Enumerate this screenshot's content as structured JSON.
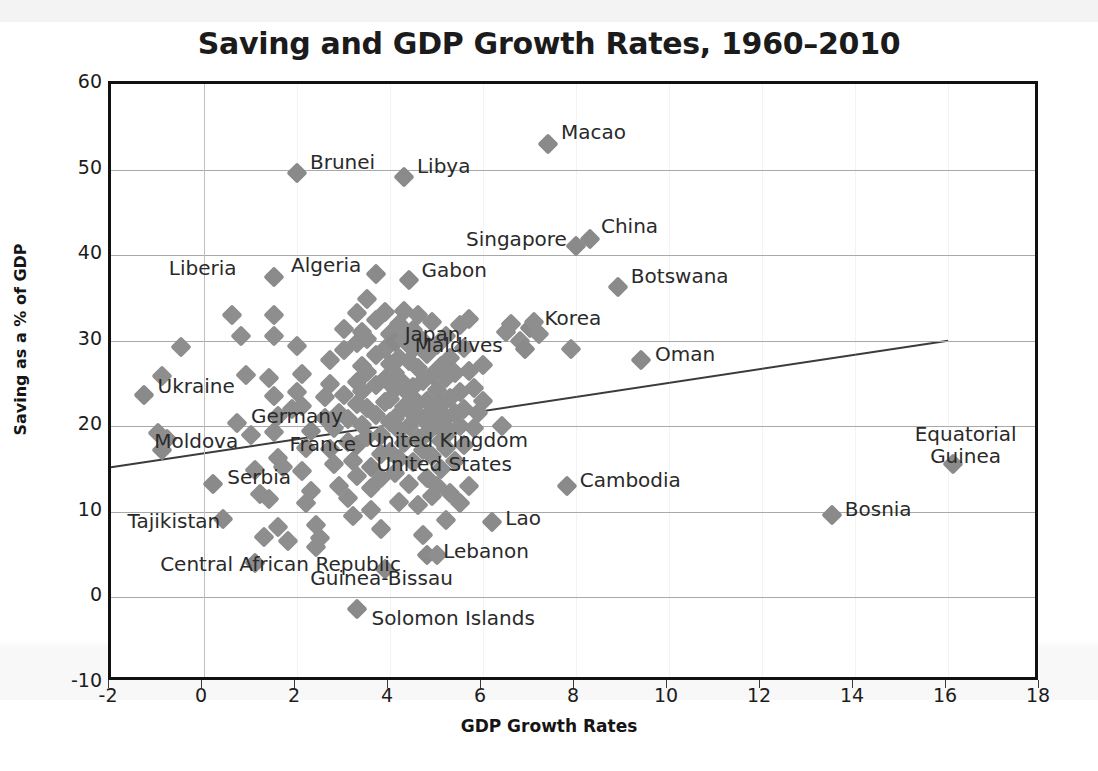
{
  "chart_data": {
    "type": "scatter",
    "title": "Saving and GDP Growth Rates, 1960–2010",
    "xlabel": "GDP Growth Rates",
    "ylabel": "Saving as a % of GDP",
    "xlim": [
      -2,
      18
    ],
    "ylim": [
      -10,
      60
    ],
    "xticks": [
      -2,
      0,
      2,
      4,
      6,
      8,
      10,
      12,
      14,
      16,
      18
    ],
    "yticks": [
      -10,
      0,
      10,
      20,
      30,
      40,
      50,
      60
    ],
    "xtick_labels": [
      "-2",
      "0",
      "2",
      "4",
      "6",
      "8",
      "10",
      "12",
      "14",
      "16",
      "18"
    ],
    "ytick_labels": [
      "-10",
      "0",
      "10",
      "20",
      "30",
      "40",
      "50",
      "60"
    ],
    "grid": "horizontal gridlines at every y tick plus vertical gridlines at every x tick (faint)",
    "legend": "none",
    "marker": {
      "shape": "diamond",
      "color": "#8e8e8e",
      "size": 15
    },
    "trendline": {
      "type": "linear",
      "color": "#3b3b3b",
      "x": [
        -2,
        16
      ],
      "y": [
        15.2,
        30.0
      ]
    },
    "labeled_points": [
      {
        "name": "Macao",
        "x": 7.4,
        "y": 53.0,
        "label_dx": 13,
        "label_dy": -11
      },
      {
        "name": "Brunei",
        "x": 2.0,
        "y": 49.6,
        "label_dx": 13,
        "label_dy": -10
      },
      {
        "name": "Libya",
        "x": 4.3,
        "y": 49.1,
        "label_dx": 13,
        "label_dy": -10
      },
      {
        "name": "China",
        "x": 8.3,
        "y": 41.9,
        "label_dx": 11,
        "label_dy": -12
      },
      {
        "name": "Singapore",
        "x": 8.0,
        "y": 41.1,
        "label_dx": -110,
        "label_dy": -6
      },
      {
        "name": "Botswana",
        "x": 8.9,
        "y": 36.3,
        "label_dx": 13,
        "label_dy": -10
      },
      {
        "name": "Liberia",
        "x": 1.5,
        "y": 37.5,
        "label_dx": -105,
        "label_dy": -8
      },
      {
        "name": "Algeria",
        "x": 3.7,
        "y": 37.8,
        "label_dx": -85,
        "label_dy": -8
      },
      {
        "name": "Gabon",
        "x": 4.4,
        "y": 37.1,
        "label_dx": 13,
        "label_dy": -9
      },
      {
        "name": "Korea",
        "x": 7.0,
        "y": 31.5,
        "label_dx": 15,
        "label_dy": -9
      },
      {
        "name": "Japan",
        "x": 4.1,
        "y": 29.9,
        "label_dx": 10,
        "label_dy": -7
      },
      {
        "name": "Maldives",
        "x": 6.9,
        "y": 29.0,
        "label_dx": -110,
        "label_dy": -3
      },
      {
        "name": "Oman",
        "x": 9.4,
        "y": 27.7,
        "label_dx": 14,
        "label_dy": -5
      },
      {
        "name": "Ukraine",
        "x": -1.3,
        "y": 23.6,
        "label_dx": 14,
        "label_dy": -8
      },
      {
        "name": "Germany",
        "x": 2.3,
        "y": 19.5,
        "label_dx": -60,
        "label_dy": -14
      },
      {
        "name": "France",
        "x": 2.7,
        "y": 17.3,
        "label_dx": -40,
        "label_dy": -4
      },
      {
        "name": "United Kingdom",
        "x": 3.3,
        "y": 17.8,
        "label_dx": 10,
        "label_dy": -4
      },
      {
        "name": "United States",
        "x": 3.6,
        "y": 15.3,
        "label_dx": 5,
        "label_dy": -2
      },
      {
        "name": "Moldova",
        "x": -0.9,
        "y": 17.2,
        "label_dx": -8,
        "label_dy": -8
      },
      {
        "name": "Serbia",
        "x": 0.2,
        "y": 13.3,
        "label_dx": 14,
        "label_dy": -6
      },
      {
        "name": "Equatorial Guinea",
        "x": 16.1,
        "y": 15.6,
        "label_dx": -38,
        "label_dy": -30
      },
      {
        "name": "Cambodia",
        "x": 7.8,
        "y": 13.0,
        "label_dx": 13,
        "label_dy": -5
      },
      {
        "name": "Bosnia",
        "x": 13.5,
        "y": 9.6,
        "label_dx": 13,
        "label_dy": -5
      },
      {
        "name": "Lao",
        "x": 6.2,
        "y": 8.8,
        "label_dx": 13,
        "label_dy": -3
      },
      {
        "name": "Tajikistan",
        "x": 0.4,
        "y": 9.2,
        "label_dx": -95,
        "label_dy": 3
      },
      {
        "name": "Lebanon",
        "x": 4.8,
        "y": 4.9,
        "label_dx": 16,
        "label_dy": -3
      },
      {
        "name": "Central African Republic",
        "x": 1.1,
        "y": 4.0,
        "label_dx": -95,
        "label_dy": 2
      },
      {
        "name": "Guinea-Bissau",
        "x": 3.9,
        "y": 3.3,
        "label_dx": -75,
        "label_dy": 10
      },
      {
        "name": "Solomon Islands",
        "x": 3.3,
        "y": -1.3,
        "label_dx": 14,
        "label_dy": 10
      }
    ],
    "points": [
      [
        -1.3,
        23.6
      ],
      [
        -0.9,
        25.9
      ],
      [
        -0.5,
        29.3
      ],
      [
        -0.9,
        17.2
      ],
      [
        -1.0,
        19.2
      ],
      [
        -0.8,
        18.5
      ],
      [
        0.2,
        13.3
      ],
      [
        0.4,
        9.2
      ],
      [
        0.6,
        33.0
      ],
      [
        0.8,
        30.5
      ],
      [
        0.9,
        26.0
      ],
      [
        0.7,
        20.4
      ],
      [
        1.0,
        19.0
      ],
      [
        1.1,
        14.9
      ],
      [
        1.2,
        12.1
      ],
      [
        1.1,
        4.0
      ],
      [
        1.3,
        7.1
      ],
      [
        1.5,
        37.5
      ],
      [
        1.5,
        33.0
      ],
      [
        1.5,
        30.5
      ],
      [
        1.4,
        25.7
      ],
      [
        1.5,
        23.5
      ],
      [
        1.6,
        21.2
      ],
      [
        1.5,
        19.3
      ],
      [
        1.6,
        16.3
      ],
      [
        1.7,
        15.3
      ],
      [
        1.4,
        11.5
      ],
      [
        1.6,
        8.2
      ],
      [
        1.8,
        6.6
      ],
      [
        1.9,
        22.0
      ],
      [
        2.0,
        49.6
      ],
      [
        2.0,
        29.4
      ],
      [
        2.1,
        26.1
      ],
      [
        2.0,
        24.0
      ],
      [
        2.1,
        22.4
      ],
      [
        2.3,
        19.5
      ],
      [
        2.2,
        17.5
      ],
      [
        2.1,
        14.8
      ],
      [
        2.3,
        12.4
      ],
      [
        2.2,
        11.0
      ],
      [
        2.4,
        8.5
      ],
      [
        2.5,
        6.9
      ],
      [
        2.4,
        5.9
      ],
      [
        2.6,
        23.4
      ],
      [
        2.6,
        21.0
      ],
      [
        2.7,
        27.7
      ],
      [
        2.7,
        25.0
      ],
      [
        2.7,
        17.3
      ],
      [
        2.8,
        19.8
      ],
      [
        2.8,
        15.6
      ],
      [
        2.9,
        13.0
      ],
      [
        2.9,
        21.5
      ],
      [
        3.0,
        31.4
      ],
      [
        3.0,
        28.9
      ],
      [
        3.0,
        23.7
      ],
      [
        3.1,
        20.8
      ],
      [
        3.1,
        18.2
      ],
      [
        3.2,
        16.0
      ],
      [
        3.1,
        11.6
      ],
      [
        3.2,
        9.5
      ],
      [
        3.3,
        33.2
      ],
      [
        3.3,
        29.7
      ],
      [
        3.3,
        25.2
      ],
      [
        3.3,
        22.6
      ],
      [
        3.3,
        17.8
      ],
      [
        3.3,
        14.2
      ],
      [
        3.3,
        -1.3
      ],
      [
        3.4,
        31.0
      ],
      [
        3.4,
        27.0
      ],
      [
        3.4,
        24.1
      ],
      [
        3.4,
        20.2
      ],
      [
        3.5,
        34.9
      ],
      [
        3.5,
        30.2
      ],
      [
        3.5,
        26.4
      ],
      [
        3.5,
        22.1
      ],
      [
        3.5,
        18.8
      ],
      [
        3.6,
        15.3
      ],
      [
        3.6,
        12.8
      ],
      [
        3.6,
        10.2
      ],
      [
        3.7,
        37.8
      ],
      [
        3.7,
        32.4
      ],
      [
        3.7,
        28.3
      ],
      [
        3.7,
        24.8
      ],
      [
        3.7,
        21.3
      ],
      [
        3.8,
        19.0
      ],
      [
        3.8,
        16.8
      ],
      [
        3.8,
        13.9
      ],
      [
        3.8,
        8.0
      ],
      [
        3.9,
        33.4
      ],
      [
        3.9,
        29.0
      ],
      [
        3.9,
        25.5
      ],
      [
        3.9,
        22.8
      ],
      [
        3.9,
        3.3
      ],
      [
        4.0,
        30.8
      ],
      [
        4.0,
        27.3
      ],
      [
        4.0,
        23.2
      ],
      [
        4.0,
        20.5
      ],
      [
        4.0,
        17.0
      ],
      [
        4.1,
        29.9
      ],
      [
        4.1,
        26.2
      ],
      [
        4.1,
        24.4
      ],
      [
        4.1,
        21.0
      ],
      [
        4.1,
        14.5
      ],
      [
        4.2,
        32.0
      ],
      [
        4.2,
        28.0
      ],
      [
        4.2,
        19.6
      ],
      [
        4.2,
        16.2
      ],
      [
        4.2,
        11.2
      ],
      [
        4.3,
        49.1
      ],
      [
        4.3,
        33.5
      ],
      [
        4.3,
        30.1
      ],
      [
        4.3,
        25.0
      ],
      [
        4.3,
        22.2
      ],
      [
        4.3,
        18.0
      ],
      [
        4.4,
        37.1
      ],
      [
        4.4,
        27.6
      ],
      [
        4.4,
        23.8
      ],
      [
        4.4,
        20.0
      ],
      [
        4.4,
        13.3
      ],
      [
        4.5,
        31.2
      ],
      [
        4.5,
        29.0
      ],
      [
        4.5,
        24.6
      ],
      [
        4.5,
        21.4
      ],
      [
        4.5,
        15.8
      ],
      [
        4.6,
        33.0
      ],
      [
        4.6,
        26.8
      ],
      [
        4.6,
        22.7
      ],
      [
        4.6,
        18.6
      ],
      [
        4.6,
        10.8
      ],
      [
        4.7,
        30.0
      ],
      [
        4.7,
        25.3
      ],
      [
        4.7,
        20.8
      ],
      [
        4.7,
        17.2
      ],
      [
        4.7,
        7.3
      ],
      [
        4.8,
        28.4
      ],
      [
        4.8,
        23.0
      ],
      [
        4.8,
        19.2
      ],
      [
        4.8,
        14.0
      ],
      [
        4.8,
        4.9
      ],
      [
        4.9,
        32.2
      ],
      [
        4.9,
        26.0
      ],
      [
        4.9,
        21.8
      ],
      [
        4.9,
        16.5
      ],
      [
        4.9,
        11.9
      ],
      [
        5.0,
        29.5
      ],
      [
        5.0,
        24.2
      ],
      [
        5.0,
        20.2
      ],
      [
        5.0,
        13.0
      ],
      [
        5.0,
        5.0
      ],
      [
        5.1,
        27.0
      ],
      [
        5.1,
        22.5
      ],
      [
        5.1,
        18.3
      ],
      [
        5.1,
        15.0
      ],
      [
        5.2,
        30.5
      ],
      [
        5.2,
        25.7
      ],
      [
        5.2,
        21.0
      ],
      [
        5.2,
        17.5
      ],
      [
        5.2,
        9.0
      ],
      [
        5.3,
        28.0
      ],
      [
        5.3,
        23.3
      ],
      [
        5.3,
        19.5
      ],
      [
        5.3,
        12.2
      ],
      [
        5.4,
        26.2
      ],
      [
        5.4,
        21.6
      ],
      [
        5.4,
        16.0
      ],
      [
        5.5,
        31.8
      ],
      [
        5.5,
        24.0
      ],
      [
        5.5,
        20.0
      ],
      [
        5.5,
        11.0
      ],
      [
        5.6,
        29.2
      ],
      [
        5.6,
        22.0
      ],
      [
        5.6,
        17.8
      ],
      [
        5.7,
        32.5
      ],
      [
        5.7,
        26.5
      ],
      [
        5.7,
        13.0
      ],
      [
        5.8,
        24.5
      ],
      [
        5.8,
        19.8
      ],
      [
        5.9,
        21.5
      ],
      [
        6.0,
        27.2
      ],
      [
        6.0,
        23.0
      ],
      [
        6.2,
        8.8
      ],
      [
        6.4,
        20.0
      ],
      [
        6.5,
        31.0
      ],
      [
        6.6,
        32.0
      ],
      [
        6.8,
        30.0
      ],
      [
        6.9,
        29.0
      ],
      [
        7.0,
        31.5
      ],
      [
        7.1,
        32.2
      ],
      [
        7.2,
        30.8
      ],
      [
        7.4,
        53.0
      ],
      [
        7.8,
        13.0
      ],
      [
        7.9,
        29.0
      ],
      [
        8.0,
        41.1
      ],
      [
        8.3,
        41.9
      ],
      [
        8.9,
        36.3
      ],
      [
        9.4,
        27.7
      ],
      [
        13.5,
        9.6
      ],
      [
        16.1,
        15.6
      ]
    ]
  }
}
